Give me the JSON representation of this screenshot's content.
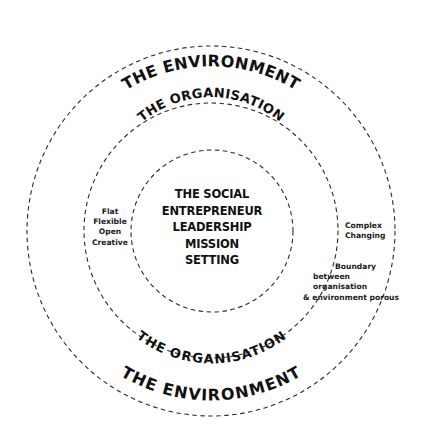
{
  "diagram": {
    "rings": {
      "outer": {
        "label_top": "THE ENVIRONMENT",
        "label_bottom": "THE ENVIRONMENT"
      },
      "middle": {
        "label_top": "THE ORGANISATION",
        "label_bottom": "THE ORGANISATION"
      },
      "inner": {
        "lines": [
          "THE SOCIAL",
          "ENTREPRENEUR",
          "LEADERSHIP",
          "MISSION",
          "SETTING"
        ]
      }
    },
    "annotations": {
      "organisation_traits": [
        "Flat",
        "Flexible",
        "Open",
        "Creative"
      ],
      "environment_traits": [
        "Complex",
        "Changing"
      ],
      "boundary": [
        "Boundary",
        "between",
        "organisation",
        "& environment porous"
      ]
    },
    "colors": {
      "line": "#2a2a2a",
      "text": "#111111",
      "background": "#ffffff"
    }
  }
}
